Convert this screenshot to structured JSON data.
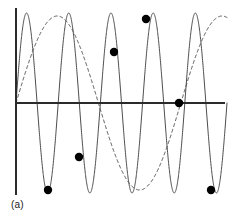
{
  "figure": {
    "caption": "(a)",
    "background_color": "#ffffff",
    "width": 235,
    "height": 219
  },
  "axes": {
    "origin_x": 16,
    "origin_y": 103,
    "x_axis_start": 16,
    "x_axis_end": 225,
    "y_axis_top": 8,
    "y_axis_bottom": 195,
    "axis_color": "#2b2b2b",
    "axis_width": 2,
    "show_ticks": false,
    "show_grid": false,
    "xlabel": "",
    "ylabel": ""
  },
  "style": {
    "signal_color": "#4a4a4a",
    "signal_width": 1,
    "alias_color": "#4a4a4a",
    "alias_width": 1,
    "alias_dash": "3 3",
    "sample_dot_color": "#000000",
    "sample_dot_radius": 4.2
  },
  "chart_data": {
    "type": "line",
    "title": "",
    "subtitle": "",
    "xlabel": "",
    "ylabel": "",
    "xlim": [
      0,
      1
    ],
    "ylim": [
      -1,
      1
    ],
    "grid": false,
    "legend": null,
    "annotations": [
      "(a)"
    ],
    "series": [
      {
        "name": "original-signal",
        "style": "solid",
        "waveform": "sine",
        "cycles": 5.0,
        "amplitude": 90,
        "phase_deg": 0,
        "direction": "up",
        "x_start": 16,
        "x_end": 227,
        "baseline_y": 103,
        "peak_y": 13,
        "trough_y": 193,
        "peaks_x": [
          32,
          74,
          116,
          158,
          200
        ],
        "troughs_x": [
          53,
          95,
          137,
          179,
          221
        ]
      },
      {
        "name": "aliased-signal",
        "style": "dashed",
        "waveform": "sine",
        "cycles": 1.28,
        "amplitude": 87,
        "phase_deg": 180,
        "direction": "down",
        "x_start": 16,
        "x_end": 227,
        "baseline_y": 103,
        "peak_y": 19,
        "trough_y": 190,
        "peaks_x": [
          146
        ],
        "troughs_x": [
          48,
          211
        ],
        "zero_crossings_x": [
          16,
          113,
          179
        ]
      }
    ],
    "sample_points": [
      {
        "index": 1,
        "x": 48,
        "y": 190,
        "value": -1.0
      },
      {
        "index": 2,
        "x": 79,
        "y": 157,
        "value": -0.62
      },
      {
        "index": 3,
        "x": 114,
        "y": 52,
        "value": 0.59
      },
      {
        "index": 4,
        "x": 146,
        "y": 19,
        "value": 0.97
      },
      {
        "index": 5,
        "x": 179,
        "y": 103,
        "value": 0.0
      },
      {
        "index": 6,
        "x": 211,
        "y": 190,
        "value": -1.0
      }
    ]
  }
}
